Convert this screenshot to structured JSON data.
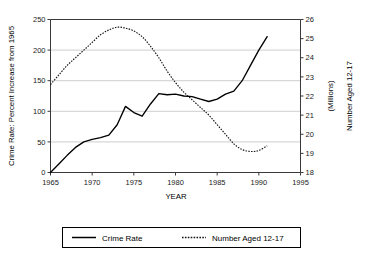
{
  "chart_data": {
    "type": "line",
    "title": "",
    "xlabel": "YEAR",
    "ylabel": "Crime Rate: Percent Increase from 1965",
    "y2label": "Number Aged 12-17",
    "y2sublabel": "(Millions)",
    "xlim": [
      1965,
      1995
    ],
    "ylim": [
      0,
      250
    ],
    "y2lim": [
      18,
      26
    ],
    "grid": true,
    "legend_position": "below",
    "xticks": [
      "1965",
      "1970",
      "1975",
      "1980",
      "1985",
      "1990",
      "1995"
    ],
    "xtick_values": [
      1965,
      1970,
      1975,
      1980,
      1985,
      1990,
      1995
    ],
    "yticks": [
      "0",
      "50",
      "100",
      "150",
      "200",
      "250"
    ],
    "ytick_values": [
      0,
      50,
      100,
      150,
      200,
      250
    ],
    "y2ticks": [
      "18",
      "19",
      "20",
      "21",
      "22",
      "23",
      "24",
      "25",
      "26"
    ],
    "y2tick_values": [
      18,
      19,
      20,
      21,
      22,
      23,
      24,
      25,
      26
    ],
    "series": [
      {
        "name": "Crime Rate",
        "axis": "left",
        "style": "solid",
        "units": "percent increase from 1965",
        "x": [
          1965,
          1966,
          1967,
          1968,
          1969,
          1970,
          1971,
          1972,
          1973,
          1974,
          1975,
          1976,
          1977,
          1978,
          1979,
          1980,
          1981,
          1982,
          1983,
          1984,
          1985,
          1986,
          1987,
          1988,
          1989,
          1990,
          1991
        ],
        "values": [
          0,
          14,
          28,
          41,
          50,
          54,
          57,
          61,
          78,
          108,
          98,
          92,
          112,
          129,
          127,
          128,
          125,
          124,
          120,
          116,
          120,
          128,
          133,
          150,
          175,
          200,
          222
        ]
      },
      {
        "name": "Number Aged 12-17",
        "axis": "right",
        "style": "dotted",
        "units": "millions",
        "x": [
          1965,
          1966,
          1967,
          1968,
          1969,
          1970,
          1971,
          1972,
          1973,
          1974,
          1975,
          1976,
          1977,
          1978,
          1979,
          1980,
          1981,
          1982,
          1983,
          1984,
          1985,
          1986,
          1987,
          1988,
          1989,
          1990,
          1991
        ],
        "values": [
          22.6,
          23.1,
          23.6,
          24.0,
          24.4,
          24.8,
          25.2,
          25.45,
          25.6,
          25.55,
          25.4,
          25.1,
          24.6,
          24.0,
          23.3,
          22.7,
          22.2,
          21.8,
          21.4,
          21.0,
          20.5,
          20.0,
          19.5,
          19.2,
          19.1,
          19.15,
          19.4
        ]
      }
    ],
    "legend": [
      {
        "label": "Crime Rate",
        "style": "solid"
      },
      {
        "label": "Number Aged 12-17",
        "style": "dotted"
      }
    ]
  }
}
